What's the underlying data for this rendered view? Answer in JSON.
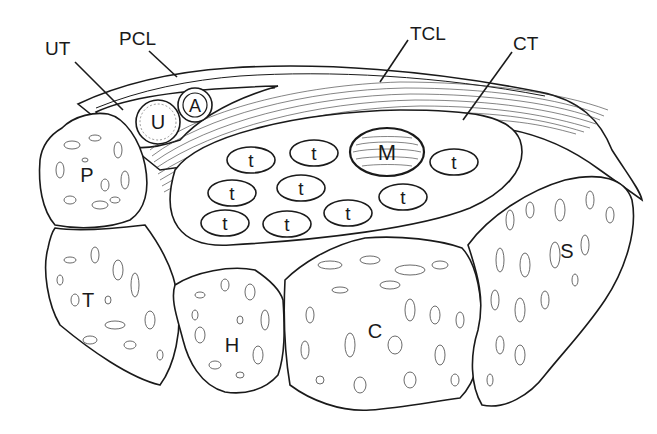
{
  "diagram": {
    "type": "anatomical-cross-section",
    "callouts": {
      "ut": "UT",
      "pcl": "PCL",
      "tcl": "TCL",
      "ct": "CT"
    },
    "bones": {
      "p": "P",
      "t": "T",
      "h": "H",
      "c": "C",
      "s": "S"
    },
    "vessels": {
      "u": "U",
      "a": "A"
    },
    "nerve": "M",
    "tendons": [
      "t",
      "t",
      "t",
      "t",
      "t",
      "t",
      "t",
      "t",
      "t"
    ]
  }
}
